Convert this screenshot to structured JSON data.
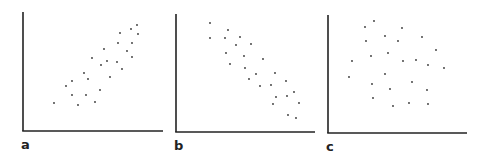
{
  "chart_data": [
    {
      "type": "scatter",
      "panel_label": "a",
      "title": "",
      "xlabel": "",
      "ylabel": "",
      "grid": false,
      "description": "positive correlation",
      "axes": {
        "x0": 23,
        "y_top": 12,
        "y_axis_bottom": 131,
        "x_end": 163
      },
      "label_pos": {
        "x": 21,
        "y": 138
      },
      "points_px": [
        [
          54,
          103
        ],
        [
          66,
          86
        ],
        [
          72,
          81
        ],
        [
          72,
          95
        ],
        [
          78,
          105
        ],
        [
          84,
          73
        ],
        [
          88,
          79
        ],
        [
          86,
          95
        ],
        [
          95,
          102
        ],
        [
          100,
          90
        ],
        [
          92,
          58
        ],
        [
          101,
          65
        ],
        [
          104,
          49
        ],
        [
          107,
          61
        ],
        [
          110,
          77
        ],
        [
          117,
          62
        ],
        [
          122,
          69
        ],
        [
          118,
          43
        ],
        [
          120,
          33
        ],
        [
          127,
          51
        ],
        [
          132,
          43
        ],
        [
          132,
          57
        ],
        [
          131,
          29
        ],
        [
          137,
          25
        ],
        [
          138,
          34
        ]
      ]
    },
    {
      "type": "scatter",
      "panel_label": "b",
      "title": "",
      "xlabel": "",
      "ylabel": "",
      "grid": false,
      "description": "negative correlation",
      "axes": {
        "x0": 176,
        "y_top": 14,
        "y_axis_bottom": 132,
        "x_end": 315
      },
      "label_pos": {
        "x": 174,
        "y": 139
      },
      "points_px": [
        [
          210,
          23
        ],
        [
          210,
          38
        ],
        [
          228,
          30
        ],
        [
          225,
          38
        ],
        [
          240,
          37
        ],
        [
          236,
          45
        ],
        [
          251,
          44
        ],
        [
          226,
          53
        ],
        [
          230,
          64
        ],
        [
          244,
          56
        ],
        [
          245,
          68
        ],
        [
          263,
          59
        ],
        [
          249,
          79
        ],
        [
          256,
          74
        ],
        [
          260,
          86
        ],
        [
          271,
          85
        ],
        [
          275,
          73
        ],
        [
          286,
          81
        ],
        [
          276,
          97
        ],
        [
          273,
          104
        ],
        [
          287,
          96
        ],
        [
          294,
          92
        ],
        [
          299,
          103
        ],
        [
          288,
          115
        ],
        [
          296,
          118
        ]
      ]
    },
    {
      "type": "scatter",
      "panel_label": "c",
      "title": "",
      "xlabel": "",
      "ylabel": "",
      "grid": false,
      "description": "no correlation",
      "axes": {
        "x0": 328,
        "y_top": 15,
        "y_axis_bottom": 133,
        "x_end": 467
      },
      "label_pos": {
        "x": 326,
        "y": 140
      },
      "points_px": [
        [
          374,
          21
        ],
        [
          365,
          27
        ],
        [
          402,
          28
        ],
        [
          385,
          36
        ],
        [
          366,
          41
        ],
        [
          398,
          41
        ],
        [
          422,
          37
        ],
        [
          436,
          50
        ],
        [
          388,
          53
        ],
        [
          371,
          56
        ],
        [
          352,
          61
        ],
        [
          403,
          61
        ],
        [
          416,
          60
        ],
        [
          428,
          65
        ],
        [
          444,
          68
        ],
        [
          349,
          77
        ],
        [
          385,
          74
        ],
        [
          372,
          84
        ],
        [
          412,
          82
        ],
        [
          390,
          89
        ],
        [
          427,
          90
        ],
        [
          373,
          98
        ],
        [
          409,
          103
        ],
        [
          393,
          106
        ],
        [
          428,
          104
        ]
      ]
    }
  ],
  "style": {
    "axis_color": "#222222",
    "point_color": "#333333"
  }
}
